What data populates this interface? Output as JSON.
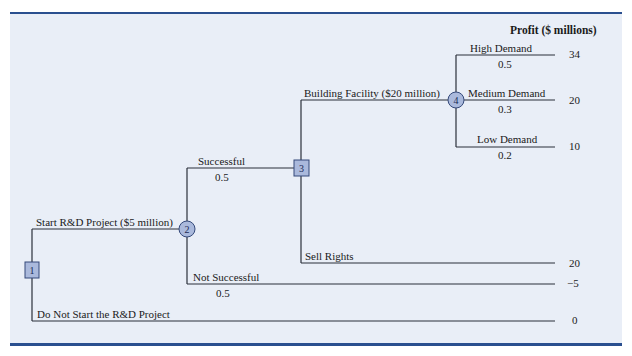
{
  "header": {
    "profit_label": "Profit ($ millions)"
  },
  "colors": {
    "rule": "#2a4f8f",
    "panel": "#e9eef7",
    "node_fill": "#aab9dc",
    "node_stroke": "#34497a",
    "line": "#2b2f3a"
  },
  "nodes": [
    {
      "id": "1",
      "type": "decision"
    },
    {
      "id": "2",
      "type": "chance"
    },
    {
      "id": "3",
      "type": "decision"
    },
    {
      "id": "4",
      "type": "chance"
    }
  ],
  "branches": {
    "start_rd": {
      "label": "Start R&D Project ($5 million)"
    },
    "successful": {
      "label": "Successful",
      "prob": "0.5"
    },
    "building": {
      "label": "Building Facility ($20 million)"
    },
    "high": {
      "label": "High Demand",
      "prob": "0.5",
      "payoff": "34"
    },
    "medium": {
      "label": "Medium Demand",
      "prob": "0.3",
      "payoff": "20"
    },
    "low": {
      "label": "Low Demand",
      "prob": "0.2",
      "payoff": "10"
    },
    "sell": {
      "label": "Sell Rights",
      "payoff": "20"
    },
    "not_successful": {
      "label": "Not Successful",
      "prob": "0.5",
      "payoff": "−5"
    },
    "do_not_start": {
      "label": "Do Not Start the R&D Project",
      "payoff": "0"
    }
  }
}
